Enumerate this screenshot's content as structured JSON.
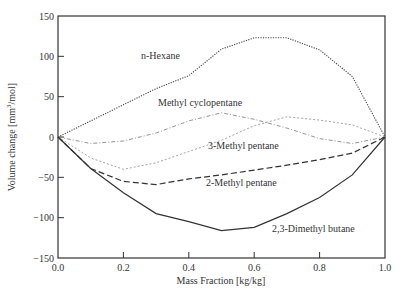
{
  "chart_data": {
    "type": "line",
    "title": "",
    "xlabel": "Mass Fraction [kg/kg]",
    "ylabel": "Volume change [mm³/mol]",
    "ylabel_base": "Volume change [mm",
    "ylabel_sup": "3",
    "ylabel_tail": "/mol]",
    "xlim": [
      0.0,
      1.0
    ],
    "ylim": [
      -150,
      150
    ],
    "xticks": [
      "0.0",
      "0.2",
      "0.4",
      "0.6",
      "0.8",
      "1.0"
    ],
    "yticks": [
      "150",
      "100",
      "50",
      "0",
      "−50",
      "−100",
      "−150"
    ],
    "grid": false,
    "legend": "inline labels",
    "x": [
      0.0,
      0.1,
      0.2,
      0.3,
      0.4,
      0.5,
      0.6,
      0.7,
      0.8,
      0.9,
      1.0
    ],
    "series": [
      {
        "name": "n-Hexane",
        "style": "dotted",
        "color": "#444444",
        "values": [
          0,
          20,
          40,
          60,
          76,
          109,
          123,
          123,
          108,
          75,
          0
        ],
        "label_pos": [
          141,
          59
        ]
      },
      {
        "name": "Methyl cyclopentane",
        "style": "dashdot",
        "color": "#888888",
        "values": [
          0,
          -8,
          -5,
          5,
          20,
          30,
          22,
          11,
          -2,
          -8,
          0
        ],
        "label_pos": [
          158,
          106
        ]
      },
      {
        "name": "3-Methyl pentane",
        "style": "dotted-light",
        "color": "#999999",
        "values": [
          0,
          -26,
          -40,
          -32,
          -18,
          -4,
          14,
          25,
          21,
          15,
          0
        ],
        "label_pos": [
          208,
          149
        ]
      },
      {
        "name": "2-Methyl pentane",
        "style": "dashed",
        "color": "#333333",
        "values": [
          0,
          -39,
          -55,
          -59,
          -52,
          -47,
          -41,
          -35,
          -28,
          -20,
          0
        ],
        "label_pos": [
          206,
          186
        ]
      },
      {
        "name": "2,3-Dimethyl butane",
        "style": "solid",
        "color": "#333333",
        "values": [
          0,
          -39,
          -69,
          -95,
          -105,
          -116,
          -112,
          -95,
          -75,
          -47,
          0
        ],
        "label_pos": [
          272,
          232
        ]
      }
    ]
  }
}
